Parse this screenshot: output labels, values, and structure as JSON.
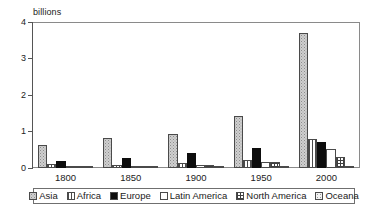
{
  "chart_data": {
    "type": "bar",
    "title": "",
    "subtitle": "",
    "xlabel": "",
    "ylabel": "billions",
    "ylim": [
      0,
      4
    ],
    "yticks": [
      0,
      1,
      2,
      3,
      4
    ],
    "grid": false,
    "legend_position": "bottom",
    "categories": [
      "1800",
      "1850",
      "1900",
      "1950",
      "2000"
    ],
    "series": [
      {
        "name": "Asia",
        "values": [
          0.64,
          0.82,
          0.95,
          1.43,
          3.72
        ]
      },
      {
        "name": "Africa",
        "values": [
          0.1,
          0.09,
          0.13,
          0.23,
          0.81
        ]
      },
      {
        "name": "Europe",
        "values": [
          0.2,
          0.28,
          0.42,
          0.55,
          0.73
        ]
      },
      {
        "name": "Latin America",
        "values": [
          0.02,
          0.03,
          0.07,
          0.17,
          0.52
        ]
      },
      {
        "name": "North America",
        "values": [
          0.01,
          0.03,
          0.08,
          0.17,
          0.31
        ]
      },
      {
        "name": "Oceana",
        "values": [
          0.002,
          0.002,
          0.006,
          0.013,
          0.031
        ]
      }
    ]
  },
  "axis": {
    "unit_label": "billions",
    "y_tick_labels": [
      "4",
      "3",
      "2",
      "1",
      "0"
    ],
    "x_tick_labels": [
      "1800",
      "1850",
      "1900",
      "1950",
      "2000"
    ]
  },
  "legend": {
    "items": [
      {
        "label": "Asia",
        "pattern": "stipple-gray",
        "color": "#cfcfcf"
      },
      {
        "label": "Africa",
        "pattern": "vertical-lines",
        "color": "#ffffff"
      },
      {
        "label": "Europe",
        "pattern": "solid",
        "color": "#0d0d0d"
      },
      {
        "label": "Latin America",
        "pattern": "plain-white",
        "color": "#ffffff"
      },
      {
        "label": "North America",
        "pattern": "cross-hatch",
        "color": "#ffffff"
      },
      {
        "label": "Oceana",
        "pattern": "fine-dots",
        "color": "#f2f2f2"
      }
    ]
  }
}
